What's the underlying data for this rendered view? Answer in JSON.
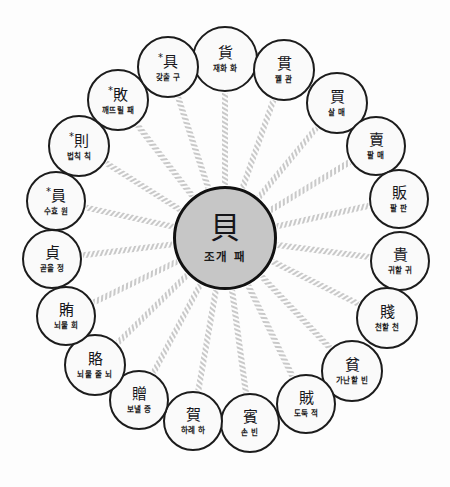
{
  "diagram": {
    "type": "radial-hub-and-spoke",
    "title_character": "貝",
    "node_count_outer": 19,
    "colors": {
      "background": "#fdfdfd",
      "center_fill": "#c6c6c6",
      "node_fill": "#fafafa",
      "node_border": "#1c1c1c",
      "spoke": "#c9c9c9",
      "text": "#16161a"
    }
  },
  "center": {
    "character": "貝",
    "gloss": "조개 패",
    "marked": false,
    "cx": 225,
    "cy": 238,
    "r": 52
  },
  "outer_nodes": [
    {
      "character": "貨",
      "gloss": "재화 화",
      "marked": false,
      "cx": 225,
      "cy": 59,
      "r": 33,
      "angle_deg": -90
    },
    {
      "character": "貫",
      "gloss": "꿸 관",
      "marked": false,
      "cx": 284,
      "cy": 70,
      "r": 31,
      "angle_deg": -71
    },
    {
      "character": "買",
      "gloss": "살 매",
      "marked": false,
      "cx": 337,
      "cy": 103,
      "r": 31,
      "angle_deg": -52
    },
    {
      "character": "賣",
      "gloss": "팔 매",
      "marked": false,
      "cx": 376,
      "cy": 146,
      "r": 30,
      "angle_deg": -33
    },
    {
      "character": "販",
      "gloss": "팔 판",
      "marked": false,
      "cx": 399,
      "cy": 199,
      "r": 30,
      "angle_deg": -14
    },
    {
      "character": "貴",
      "gloss": "귀할 귀",
      "marked": false,
      "cx": 400,
      "cy": 261,
      "r": 30,
      "angle_deg": 5
    },
    {
      "character": "賤",
      "gloss": "천할 천",
      "marked": false,
      "cx": 387,
      "cy": 318,
      "r": 31,
      "angle_deg": 24
    },
    {
      "character": "貧",
      "gloss": "가난할 빈",
      "marked": false,
      "cx": 352,
      "cy": 371,
      "r": 31,
      "angle_deg": 43
    },
    {
      "character": "賊",
      "gloss": "도둑 적",
      "marked": false,
      "cx": 306,
      "cy": 404,
      "r": 30,
      "angle_deg": 62
    },
    {
      "character": "賓",
      "gloss": "손 빈",
      "marked": false,
      "cx": 250,
      "cy": 423,
      "r": 30,
      "angle_deg": 81
    },
    {
      "character": "賀",
      "gloss": "하례 하",
      "marked": false,
      "cx": 193,
      "cy": 421,
      "r": 30,
      "angle_deg": 100
    },
    {
      "character": "贈",
      "gloss": "보낼 증",
      "marked": false,
      "cx": 139,
      "cy": 400,
      "r": 30,
      "angle_deg": 119
    },
    {
      "character": "賂",
      "gloss": "뇌물 줄 뇌",
      "marked": false,
      "cx": 95,
      "cy": 365,
      "r": 31,
      "angle_deg": 138
    },
    {
      "character": "賄",
      "gloss": "뇌물 회",
      "marked": false,
      "cx": 66,
      "cy": 316,
      "r": 30,
      "angle_deg": 157
    },
    {
      "character": "貞",
      "gloss": "곧을 정",
      "marked": false,
      "cx": 52,
      "cy": 259,
      "r": 30,
      "angle_deg": 176
    },
    {
      "character": "員",
      "gloss": "수효 원",
      "marked": true,
      "cx": 56,
      "cy": 201,
      "r": 30,
      "angle_deg": 195
    },
    {
      "character": "則",
      "gloss": "법칙 칙",
      "marked": true,
      "cx": 79,
      "cy": 146,
      "r": 31,
      "angle_deg": 214
    },
    {
      "character": "敗",
      "gloss": "깨뜨릴 패",
      "marked": true,
      "cx": 118,
      "cy": 100,
      "r": 31,
      "angle_deg": 233
    },
    {
      "character": "具",
      "gloss": "갖출 구",
      "marked": true,
      "cx": 168,
      "cy": 67,
      "r": 31,
      "angle_deg": 252
    }
  ]
}
